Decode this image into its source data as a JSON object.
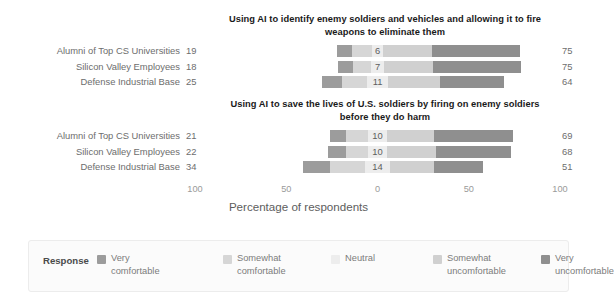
{
  "axis": {
    "title": "Percentage of respondents",
    "ticks": [
      {
        "label": "100",
        "pos": -100
      },
      {
        "label": "50",
        "pos": -50
      },
      {
        "label": "0",
        "pos": 0
      },
      {
        "label": "50",
        "pos": 50
      },
      {
        "label": "100",
        "pos": 100
      }
    ]
  },
  "legend": {
    "title": "Response",
    "items": [
      {
        "label": "Very\ncomfortable",
        "color": "#9c9c9c"
      },
      {
        "label": "Somewhat\ncomfortable",
        "color": "#d6d6d6"
      },
      {
        "label": "Neutral",
        "color": "#ededed"
      },
      {
        "label": "Somewhat\nuncomfortable",
        "color": "#d0d0d0"
      },
      {
        "label": "Very\nuncomfortable",
        "color": "#8f8f8f"
      }
    ]
  },
  "chart_data": {
    "type": "bar",
    "subtype": "diverging-stacked-likert",
    "xlabel": "Percentage of respondents",
    "ylabel": "",
    "xlim": [
      -100,
      100
    ],
    "xticks": [
      -100,
      -50,
      0,
      50,
      100
    ],
    "xticklabels": [
      "100",
      "50",
      "0",
      "50",
      "100"
    ],
    "grid": false,
    "legend_position": "bottom",
    "series": [
      {
        "name": "Very comfortable",
        "color": "#9c9c9c"
      },
      {
        "name": "Somewhat comfortable",
        "color": "#d6d6d6"
      },
      {
        "name": "Neutral",
        "color": "#ededed"
      },
      {
        "name": "Somewhat uncomfortable",
        "color": "#d0d0d0"
      },
      {
        "name": "Very uncomfortable",
        "color": "#8f8f8f"
      }
    ],
    "panels": [
      {
        "title": "Using AI to identify enemy soldiers and vehicles and allowing it to fire weapons to eliminate them",
        "categories": [
          "Alumni of Top CS Universities",
          "Silicon Valley Employees",
          "Defense Industrial Base"
        ],
        "rows": [
          {
            "category": "Alumni of Top CS Universities",
            "left_total": 19,
            "neutral": 6,
            "right_total": 75,
            "very_comfortable": 8,
            "somewhat_comfortable": 11,
            "somewhat_uncomfortable": 27,
            "very_uncomfortable": 48
          },
          {
            "category": "Silicon Valley Employees",
            "left_total": 18,
            "neutral": 7,
            "right_total": 75,
            "very_comfortable": 8,
            "somewhat_comfortable": 10,
            "somewhat_uncomfortable": 27,
            "very_uncomfortable": 48
          },
          {
            "category": "Defense Industrial Base",
            "left_total": 25,
            "neutral": 11,
            "right_total": 64,
            "very_comfortable": 11,
            "somewhat_comfortable": 14,
            "somewhat_uncomfortable": 29,
            "very_uncomfortable": 35
          }
        ]
      },
      {
        "title": "Using AI to save the lives of U.S. soldiers by firing on enemy soldiers before they do harm",
        "categories": [
          "Alumni of Top CS Universities",
          "Silicon Valley Employees",
          "Defense Industrial Base"
        ],
        "rows": [
          {
            "category": "Alumni of Top CS Universities",
            "left_total": 21,
            "neutral": 10,
            "right_total": 69,
            "very_comfortable": 9,
            "somewhat_comfortable": 12,
            "somewhat_uncomfortable": 26,
            "very_uncomfortable": 43
          },
          {
            "category": "Silicon Valley Employees",
            "left_total": 22,
            "neutral": 10,
            "right_total": 68,
            "very_comfortable": 10,
            "somewhat_comfortable": 12,
            "somewhat_uncomfortable": 27,
            "very_uncomfortable": 41
          },
          {
            "category": "Defense Industrial Base",
            "left_total": 34,
            "neutral": 14,
            "right_total": 51,
            "very_comfortable": 15,
            "somewhat_comfortable": 19,
            "somewhat_uncomfortable": 24,
            "very_uncomfortable": 27
          }
        ]
      }
    ]
  }
}
